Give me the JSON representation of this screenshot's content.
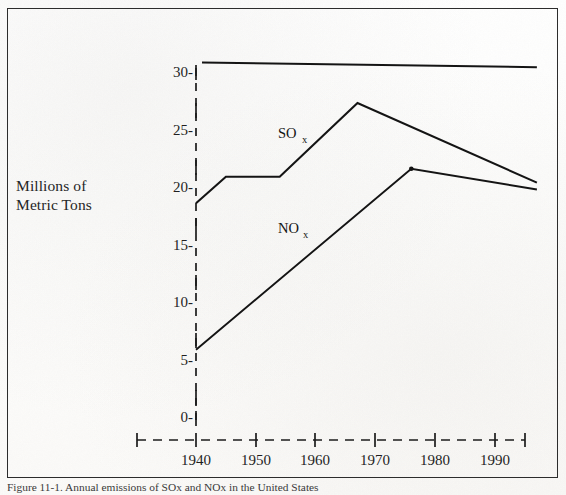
{
  "figure": {
    "y_axis_title": "Millions of\nMetric Tons",
    "caption": "Figure 11-1. Annual emissions of SOx and NOx in the United States"
  },
  "chart_data": {
    "type": "line",
    "title": "",
    "xlabel": "",
    "ylabel": "Millions of Metric Tons",
    "xlim": [
      1935,
      1998
    ],
    "ylim": [
      0,
      32
    ],
    "grid": false,
    "legend": "inline-labels",
    "x_ticks": [
      1940,
      1950,
      1960,
      1970,
      1980,
      1990
    ],
    "x_tick_labels": [
      "1940",
      "1950",
      "1960",
      "1970",
      "1980",
      "1990"
    ],
    "y_ticks": [
      0,
      5,
      10,
      15,
      20,
      25,
      30
    ],
    "y_tick_labels": [
      "0-",
      "5-",
      "10-",
      "15-",
      "20-",
      "25-",
      "30-"
    ],
    "axis_style": "dashed",
    "series": [
      {
        "name": "SOx",
        "label": "SO",
        "subscript": "x",
        "label_x": 1955,
        "label_y": 24.6,
        "points": [
          {
            "x": 1940,
            "y": 18.7
          },
          {
            "x": 1945,
            "y": 21.0
          },
          {
            "x": 1954,
            "y": 21.0
          },
          {
            "x": 1967,
            "y": 27.4
          },
          {
            "x": 1997,
            "y": 20.5
          }
        ]
      },
      {
        "name": "NOx",
        "label": "NO",
        "subscript": "x",
        "label_x": 1955,
        "label_y": 16.5,
        "points": [
          {
            "x": 1940,
            "y": 6.0
          },
          {
            "x": 1976,
            "y": 21.7
          },
          {
            "x": 1997,
            "y": 19.9
          }
        ]
      },
      {
        "name": "top-reference-line",
        "label": "",
        "subscript": "",
        "points": [
          {
            "x": 1941,
            "y": 30.9
          },
          {
            "x": 1997,
            "y": 30.5
          }
        ]
      }
    ]
  }
}
